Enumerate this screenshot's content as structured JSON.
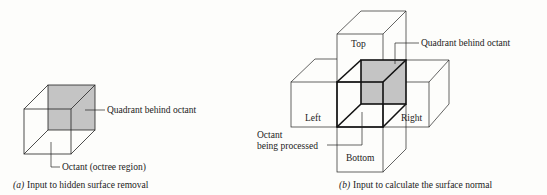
{
  "figure_a": {
    "caption_prefix": "(a)",
    "caption": "Input to hidden surface removal",
    "labels": {
      "quadrant": "Quadrant behind octant",
      "octant": "Octant (octree region)"
    }
  },
  "figure_b": {
    "caption_prefix": "(b)",
    "caption": "Input to calculate the surface normal",
    "labels": {
      "top": "Top",
      "left": "Left",
      "right": "Right",
      "bottom": "Bottom",
      "quadrant": "Quadrant behind octant",
      "octant_line1": "Octant",
      "octant_line2": "being processed"
    }
  },
  "colors": {
    "line": "#222222",
    "shade": "#c4c4c4",
    "background": "#fdfdfb"
  }
}
